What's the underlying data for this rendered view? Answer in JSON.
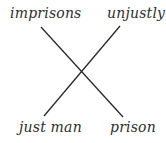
{
  "diagram": {
    "type": "chiasmus",
    "labels": {
      "top_left": "imprisons",
      "top_right": "unjustly",
      "bottom_left": "just man",
      "bottom_right": "prison"
    },
    "connections": [
      {
        "from": "imprisons",
        "to": "prison"
      },
      {
        "from": "unjustly",
        "to": "just man"
      }
    ],
    "colors": {
      "text": "#2e2e2e",
      "line": "#2a2a2a",
      "background": "#ffffff"
    }
  }
}
